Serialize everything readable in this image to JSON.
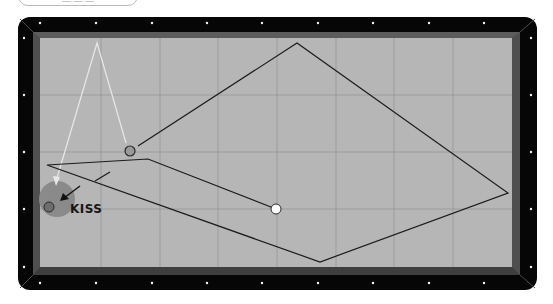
{
  "header": {
    "tab_label": "— — —"
  },
  "table": {
    "rail_color": "#060606",
    "cushion_color": "#4f4f4f",
    "felt_color": "#b6b6b6",
    "grid_color": "#8f8f8f",
    "diamond_color": "#f2f2f2",
    "rail_outer": {
      "x": 18,
      "y": 17,
      "w": 519,
      "h": 273,
      "radius": 12
    },
    "felt": {
      "x": 40,
      "y": 38,
      "w": 472,
      "h": 229
    },
    "grid": {
      "verticals": [
        101,
        160,
        218,
        277,
        336,
        394,
        453
      ],
      "horizontals": [
        95,
        152,
        209
      ]
    },
    "diamonds_top": [
      40,
      96,
      152,
      207,
      262,
      318,
      373,
      429,
      484
    ],
    "diamonds_bottom": [
      40,
      96,
      152,
      207,
      262,
      318,
      373,
      429,
      484
    ],
    "diamonds_left": [
      38,
      95,
      152,
      209,
      267
    ],
    "diamonds_right": [
      38,
      95,
      152,
      209,
      267
    ]
  },
  "diagram": {
    "cue_ball": {
      "x": 276,
      "y": 209,
      "r": 5,
      "color": "#ffffff"
    },
    "object_ball": {
      "x": 130,
      "y": 151,
      "r": 5,
      "color": "#9a9a9a"
    },
    "kiss_ball": {
      "x": 49,
      "y": 207,
      "r": 5,
      "color": "#6e6e6e"
    },
    "kiss_zone": {
      "x": 57,
      "y": 199,
      "r": 18,
      "color": "#8a8a8a"
    },
    "cue_ball_path": [
      [
        276,
        209
      ],
      [
        148,
        159
      ],
      [
        47,
        165
      ],
      [
        320,
        262
      ],
      [
        508,
        193
      ],
      [
        297,
        43
      ],
      [
        138,
        146
      ]
    ],
    "object_ball_path_dashed": [
      [
        110,
        172
      ],
      [
        95,
        181
      ]
    ],
    "white_path": [
      [
        57,
        178
      ],
      [
        97,
        43
      ],
      [
        126,
        143
      ]
    ],
    "kiss_arrow": {
      "from": [
        80,
        186
      ],
      "to": [
        60,
        201
      ]
    },
    "kiss_label": "KISS"
  }
}
